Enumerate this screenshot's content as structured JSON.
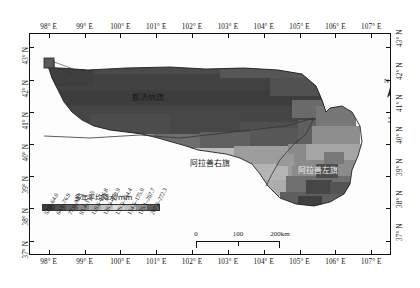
{
  "map": {
    "title": "",
    "axes": {
      "longitude_ticks": [
        "98° E",
        "99° E",
        "100° E",
        "101° E",
        "102° E",
        "103° E",
        "104° E",
        "105° E",
        "106° E",
        "107° E"
      ],
      "latitude_ticks": [
        "43° N",
        "42° N",
        "41° N",
        "40° N",
        "39° N",
        "38° N",
        "37° N"
      ],
      "lon_range": [
        97.45,
        107.55
      ],
      "lat_range": [
        36.55,
        43.45
      ]
    },
    "regions": [
      {
        "name": "额济纳旗"
      },
      {
        "name": "阿拉善右旗"
      },
      {
        "name": "阿拉善左旗"
      }
    ],
    "north_arrow_label": "N"
  },
  "legend": {
    "title": "多年平均降水/mm",
    "classes": [
      {
        "label": "52.8–64.0",
        "color": "#3a3a3a"
      },
      {
        "label": "64.1–76.9",
        "color": "#4e4e4e"
      },
      {
        "label": "77.0–93.3",
        "color": "#646464"
      },
      {
        "label": "93.4–110.5",
        "color": "#8a8a8a"
      },
      {
        "label": "110.6–126.8",
        "color": "#a8a8a8"
      },
      {
        "label": "126.9–138.9",
        "color": "#c4c4c4"
      },
      {
        "label": "139.0–154.4",
        "color": "#dcdcdc"
      },
      {
        "label": "154.5–175.0",
        "color": "#bdbdbd"
      },
      {
        "label": "175.1–207.7",
        "color": "#8f8f8f"
      },
      {
        "label": "207.8–272.3",
        "color": "#5c5c5c"
      }
    ]
  },
  "scalebar": {
    "labels": [
      "0",
      "100",
      "200km"
    ],
    "max_km": 200
  }
}
